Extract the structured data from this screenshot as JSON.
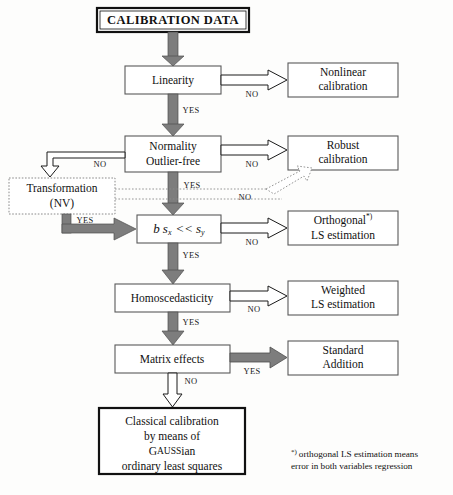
{
  "diagram": {
    "background_color": "#fdfdfc",
    "line_color": "#1a1a1a",
    "thick_arrow_color": "#7d7d7d"
  },
  "boxes": {
    "calibration_data": {
      "label": "CALIBRATION DATA",
      "style": "double-border"
    },
    "linearity": {
      "label": "Linearity",
      "style": "plain"
    },
    "normality": {
      "label_line1": "Normality",
      "label_line2": "Outlier-free",
      "style": "plain"
    },
    "transformation": {
      "label_line1": "Transformation",
      "label_line2": "(NV)",
      "style": "dotted"
    },
    "bsx": {
      "math": "b s_x << s_y",
      "b": "b",
      "s1": "s",
      "sub1": "x",
      "op": "<<",
      "s2": "s",
      "sub2": "y",
      "style": "plain"
    },
    "homoscedasticity": {
      "label": "Homoscedasticity",
      "style": "plain"
    },
    "matrix_effects": {
      "label": "Matrix effects",
      "style": "plain"
    },
    "nonlinear_calibration": {
      "label_line1": "Nonlinear",
      "label_line2": "calibration",
      "style": "plain"
    },
    "robust_calibration": {
      "label_line1": "Robust",
      "label_line2": "calibration",
      "style": "plain"
    },
    "orthogonal_ls": {
      "label_line1": "Orthogonal",
      "superscript": "*)",
      "label_line2": "LS estimation",
      "style": "plain"
    },
    "weighted_ls": {
      "label_line1": "Weighted",
      "label_line2": "LS estimation",
      "style": "plain"
    },
    "standard_addition": {
      "label_line1": "Standard",
      "label_line2": "Addition",
      "style": "plain"
    },
    "classical_calibration": {
      "line1": "Classical calibration",
      "line2": "by means of",
      "line3_a": "G",
      "line3_b": "AUSS",
      "line3_c": "ian",
      "line4": "ordinary least squares",
      "style": "thick-border"
    }
  },
  "edge_labels": {
    "linearity_no": "NO",
    "linearity_yes": "YES",
    "normality_no_right": "NO",
    "normality_no_left": "NO",
    "normality_yes": "YES",
    "transformation_no": "NO",
    "transformation_yes": "YES",
    "bsx_no": "NO",
    "bsx_yes": "YES",
    "homoscedasticity_no": "NO",
    "homoscedasticity_yes": "YES",
    "matrix_yes": "YES",
    "matrix_no": "NO"
  },
  "footnote": {
    "marker": "*)",
    "line1": "orthogonal LS estimation means",
    "line2": "error in both variables regression"
  }
}
